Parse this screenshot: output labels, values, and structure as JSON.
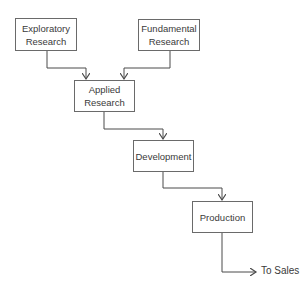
{
  "diagram": {
    "nodes": [
      {
        "id": "exploratory",
        "lines": [
          "Exploratory",
          "Research"
        ]
      },
      {
        "id": "fundamental",
        "lines": [
          "Fundamental",
          "Research"
        ]
      },
      {
        "id": "applied",
        "lines": [
          "Applied",
          "Research"
        ]
      },
      {
        "id": "development",
        "lines": [
          "Development"
        ]
      },
      {
        "id": "production",
        "lines": [
          "Production"
        ]
      }
    ],
    "edges": [
      {
        "from": "exploratory",
        "to": "applied"
      },
      {
        "from": "fundamental",
        "to": "applied"
      },
      {
        "from": "applied",
        "to": "development"
      },
      {
        "from": "development",
        "to": "production"
      },
      {
        "from": "production",
        "to": "sales"
      }
    ],
    "output_label": "To Sales",
    "colors": {
      "line": "#4a4a4a",
      "border": "#6a6a6a",
      "text": "#3a3a3a"
    }
  }
}
